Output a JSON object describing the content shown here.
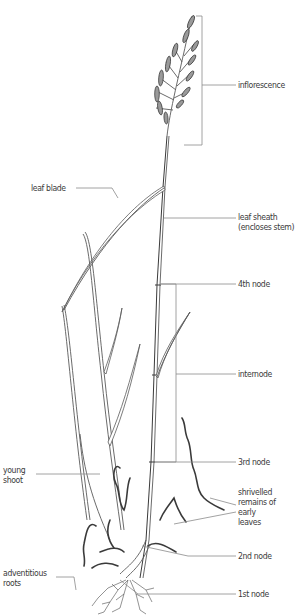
{
  "diagram": {
    "labels": [
      {
        "id": "inflorescence",
        "lines": [
          "inflorescence"
        ]
      },
      {
        "id": "leaf-blade",
        "lines": [
          "leaf blade"
        ]
      },
      {
        "id": "leaf-sheath",
        "lines": [
          "leaf sheath",
          "(encloses stem)"
        ]
      },
      {
        "id": "4th-node",
        "lines": [
          "4th node"
        ]
      },
      {
        "id": "internode",
        "lines": [
          "internode"
        ]
      },
      {
        "id": "3rd-node",
        "lines": [
          "3rd node"
        ]
      },
      {
        "id": "young-shoot",
        "lines": [
          "young",
          "shoot"
        ]
      },
      {
        "id": "shrivelled-remains",
        "lines": [
          "shrivelled",
          "remains of",
          "early",
          "leaves"
        ]
      },
      {
        "id": "2nd-node",
        "lines": [
          "2nd node"
        ]
      },
      {
        "id": "adventitious-roots",
        "lines": [
          "adventitious",
          "roots"
        ]
      },
      {
        "id": "1st-node",
        "lines": [
          "1st node"
        ]
      }
    ],
    "colors": {
      "background": "#ffffff",
      "text": "#3a3a3a",
      "leader_lines": "#8a8a8a",
      "drawing": "#4a4a4a"
    }
  }
}
